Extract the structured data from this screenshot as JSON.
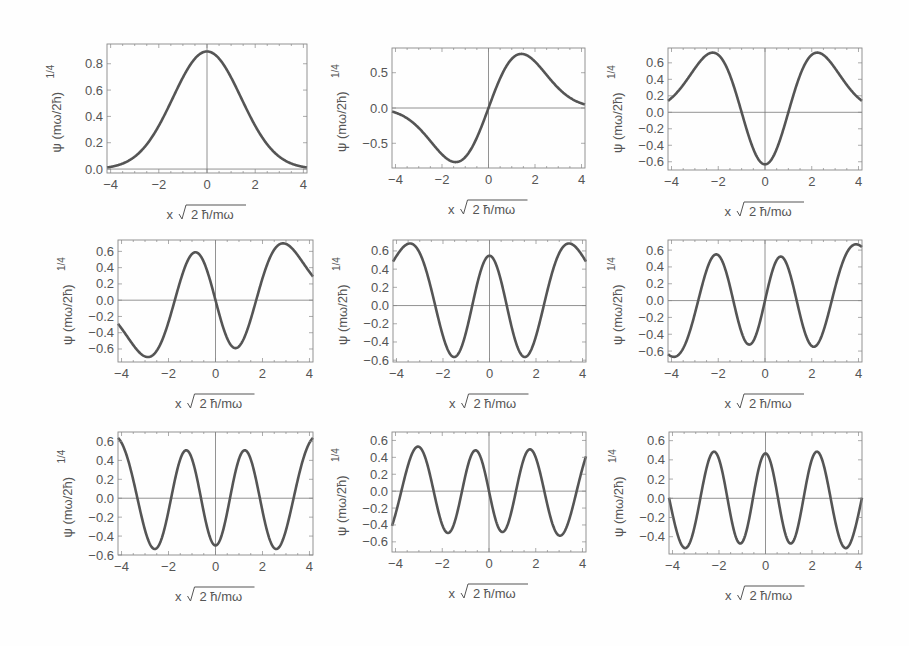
{
  "figure": {
    "xlabel": "x √2 ħ/mω",
    "xlabel_prefix": "x",
    "xlabel_sqrt": "2 ħ/mω",
    "ylabel": "ψ (mω/2ħ)^1/4",
    "ylabel_main": "ψ (mω/2ħ)",
    "ylabel_sup": "1/4",
    "colors": {
      "curve": "#555555",
      "frame": "#888888",
      "axis": "#777777",
      "text": "#555555",
      "background": "#fefefe"
    }
  },
  "chart_data": [
    {
      "type": "line",
      "n": 0,
      "title": "",
      "xlabel": "x √2 ħ/mω",
      "ylabel": "ψ (mω/2ħ)^1/4",
      "xlim": [
        -4.15,
        4.15
      ],
      "ylim": [
        -0.03,
        0.95
      ],
      "xticks": [
        -4,
        -2,
        0,
        2,
        4
      ],
      "yticks": [
        0.0,
        0.2,
        0.4,
        0.6,
        0.8
      ],
      "ytick_labels": [
        "0.0",
        "0.2",
        "0.4",
        "0.6",
        "0.8"
      ],
      "peak": 0.89,
      "extrema": [
        [
          0,
          0.89
        ]
      ]
    },
    {
      "type": "line",
      "n": 1,
      "title": "",
      "xlabel": "x √2 ħ/mω",
      "ylabel": "ψ (mω/2ħ)^1/4",
      "xlim": [
        -4.15,
        4.15
      ],
      "ylim": [
        -0.85,
        0.85
      ],
      "xticks": [
        -4,
        -2,
        0,
        2,
        4
      ],
      "yticks": [
        -0.5,
        0.0,
        0.5
      ],
      "ytick_labels": [
        "-0.5",
        "0.0",
        "0.5"
      ],
      "extrema": [
        [
          -0.71,
          -0.77
        ],
        [
          0.71,
          0.77
        ]
      ]
    },
    {
      "type": "line",
      "n": 2,
      "title": "",
      "xlabel": "x √2 ħ/mω",
      "ylabel": "ψ (mω/2ħ)^1/4",
      "xlim": [
        -4.15,
        4.15
      ],
      "ylim": [
        -0.7,
        0.78
      ],
      "xticks": [
        -4,
        -2,
        0,
        2,
        4
      ],
      "yticks": [
        -0.6,
        -0.4,
        -0.2,
        0.0,
        0.2,
        0.4,
        0.6
      ],
      "ytick_labels": [
        "-0.6",
        "-0.4",
        "-0.2",
        "0.0",
        "0.2",
        "0.4",
        "0.6"
      ],
      "extrema": [
        [
          -1.12,
          0.72
        ],
        [
          0,
          -0.63
        ],
        [
          1.12,
          0.72
        ]
      ]
    },
    {
      "type": "line",
      "n": 3,
      "title": "",
      "xlabel": "x √2 ħ/mω",
      "ylabel": "ψ (mω/2ħ)^1/4",
      "xlim": [
        -4.15,
        4.15
      ],
      "ylim": [
        -0.76,
        0.74
      ],
      "xticks": [
        -4,
        -2,
        0,
        2,
        4
      ],
      "yticks": [
        -0.6,
        -0.4,
        -0.2,
        0.0,
        0.2,
        0.4,
        0.6
      ],
      "ytick_labels": [
        "-0.6",
        "-0.4",
        "-0.2",
        "0.0",
        "0.2",
        "0.4",
        "0.6"
      ],
      "extrema": [
        [
          -1.46,
          -0.68
        ],
        [
          -0.42,
          0.56
        ],
        [
          0.42,
          -0.56
        ],
        [
          1.46,
          0.68
        ]
      ]
    },
    {
      "type": "line",
      "n": 4,
      "title": "",
      "xlabel": "x √2 ħ/mω",
      "ylabel": "ψ (mω/2ħ)^1/4",
      "xlim": [
        -4.15,
        4.15
      ],
      "ylim": [
        -0.62,
        0.72
      ],
      "xticks": [
        -4,
        -2,
        0,
        2,
        4
      ],
      "yticks": [
        -0.6,
        -0.4,
        -0.2,
        0.0,
        0.2,
        0.4,
        0.6
      ],
      "ytick_labels": [
        "-0.6",
        "-0.4",
        "-0.2",
        "0.0",
        "0.2",
        "0.4",
        "0.6"
      ],
      "extrema": [
        [
          -1.75,
          0.66
        ],
        [
          -0.77,
          -0.57
        ],
        [
          0,
          0.52
        ],
        [
          0.77,
          -0.57
        ],
        [
          1.75,
          0.66
        ]
      ]
    },
    {
      "type": "line",
      "n": 5,
      "title": "",
      "xlabel": "x √2 ħ/mω",
      "ylabel": "ψ (mω/2ħ)^1/4",
      "xlim": [
        -4.15,
        4.15
      ],
      "ylim": [
        -0.73,
        0.72
      ],
      "xticks": [
        -4,
        -2,
        0,
        2,
        4
      ],
      "yticks": [
        -0.6,
        -0.4,
        -0.2,
        0.0,
        0.2,
        0.4,
        0.6
      ],
      "ytick_labels": [
        "-0.6",
        "-0.4",
        "-0.2",
        "0.0",
        "0.2",
        "0.4",
        "0.6"
      ],
      "extrema": [
        [
          -2.0,
          -0.65
        ],
        [
          -1.06,
          0.53
        ],
        [
          -0.35,
          -0.5
        ],
        [
          0.35,
          0.5
        ],
        [
          1.06,
          -0.53
        ],
        [
          2.0,
          0.65
        ]
      ]
    },
    {
      "type": "line",
      "n": 6,
      "title": "",
      "xlabel": "x √2 ħ/mω",
      "ylabel": "ψ (mω/2ħ)^1/4",
      "xlim": [
        -4.15,
        4.15
      ],
      "ylim": [
        -0.6,
        0.7
      ],
      "xticks": [
        -4,
        -2,
        0,
        2,
        4
      ],
      "yticks": [
        -0.6,
        -0.4,
        -0.2,
        0.0,
        0.2,
        0.4,
        0.6
      ],
      "ytick_labels": [
        "-0.6",
        "-0.4",
        "-0.2",
        "0.0",
        "0.2",
        "0.4",
        "0.6"
      ],
      "extrema": [
        [
          -2.2,
          0.64
        ],
        [
          -1.3,
          -0.54
        ],
        [
          -0.63,
          0.49
        ],
        [
          0,
          -0.5
        ],
        [
          0.63,
          0.49
        ],
        [
          1.3,
          -0.54
        ],
        [
          2.2,
          0.64
        ]
      ]
    },
    {
      "type": "line",
      "n": 7,
      "title": "",
      "xlabel": "x √2 ħ/mω",
      "ylabel": "ψ (mω/2ħ)^1/4",
      "xlim": [
        -4.15,
        4.15
      ],
      "ylim": [
        -0.72,
        0.7
      ],
      "xticks": [
        -4,
        -2,
        0,
        2,
        4
      ],
      "yticks": [
        -0.6,
        -0.4,
        -0.2,
        0.0,
        0.2,
        0.4,
        0.6
      ],
      "ytick_labels": [
        "-0.6",
        "-0.4",
        "-0.2",
        "0.0",
        "0.2",
        "0.4",
        "0.6"
      ],
      "extrema": [
        [
          -2.4,
          -0.63
        ],
        [
          -1.53,
          0.5
        ],
        [
          -0.87,
          -0.47
        ],
        [
          -0.28,
          0.46
        ],
        [
          0.28,
          -0.46
        ],
        [
          0.87,
          0.47
        ],
        [
          1.53,
          -0.5
        ],
        [
          2.4,
          0.63
        ]
      ]
    },
    {
      "type": "line",
      "n": 8,
      "title": "",
      "xlabel": "x √2 ħ/mω",
      "ylabel": "ψ (mω/2ħ)^1/4",
      "xlim": [
        -4.15,
        4.15
      ],
      "ylim": [
        -0.58,
        0.69
      ],
      "xticks": [
        -4,
        -2,
        0,
        2,
        4
      ],
      "yticks": [
        -0.4,
        -0.2,
        0.0,
        0.2,
        0.4,
        0.6
      ],
      "ytick_labels": [
        "-0.4",
        "-0.2",
        "0.0",
        "0.2",
        "0.4",
        "0.6"
      ],
      "extrema": [
        [
          -2.6,
          0.62
        ],
        [
          -1.75,
          -0.52
        ],
        [
          -1.1,
          0.47
        ],
        [
          -0.53,
          -0.45
        ],
        [
          0,
          0.44
        ],
        [
          0.53,
          -0.45
        ],
        [
          1.1,
          0.47
        ],
        [
          1.75,
          -0.52
        ],
        [
          2.6,
          0.62
        ]
      ]
    }
  ],
  "panels": [
    {
      "left": 107,
      "top": 44,
      "width": 200,
      "height": 129
    },
    {
      "left": 392,
      "top": 48,
      "width": 193,
      "height": 120
    },
    {
      "left": 668,
      "top": 48,
      "width": 194,
      "height": 122
    },
    {
      "left": 118,
      "top": 240,
      "width": 195,
      "height": 122
    },
    {
      "left": 393,
      "top": 240,
      "width": 193,
      "height": 122
    },
    {
      "left": 668,
      "top": 240,
      "width": 194,
      "height": 122
    },
    {
      "left": 118,
      "top": 432,
      "width": 195,
      "height": 123
    },
    {
      "left": 392,
      "top": 432,
      "width": 194,
      "height": 120
    },
    {
      "left": 669,
      "top": 432,
      "width": 193,
      "height": 122
    }
  ]
}
